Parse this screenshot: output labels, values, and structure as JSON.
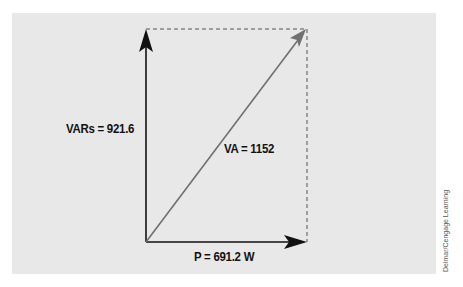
{
  "diagram": {
    "type": "power-triangle-phasor",
    "labels": {
      "vars": "VARs = 921.6",
      "va": "VA = 1152",
      "p": "P = 691.2 W"
    },
    "vectors": [
      {
        "name": "reactive-power",
        "label": "VARs = 921.6",
        "direction": "up",
        "color": "#111111"
      },
      {
        "name": "apparent-power",
        "label": "VA = 1152",
        "direction": "diagonal",
        "color": "#707070"
      },
      {
        "name": "true-power",
        "label": "P = 691.2 W",
        "direction": "right",
        "color": "#111111"
      }
    ],
    "colors": {
      "background": "#e8e8e8",
      "axis": "#111111",
      "hypotenuse": "#707070",
      "dashed": "#555555"
    }
  },
  "credit": "Delmar/Cengage Learning"
}
